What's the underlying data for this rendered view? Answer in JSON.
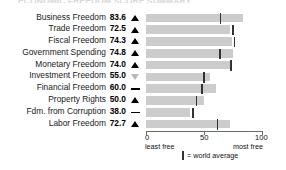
{
  "title_cut": "ECONOMIC FREEDOM SCORE SUMMARY",
  "chart_data": {
    "type": "bar",
    "title": "Economic Freedom Score Summary",
    "xlabel": "",
    "ylabel": "",
    "xlim": [
      0,
      100
    ],
    "grid": false,
    "orientation": "horizontal",
    "categories": [
      "Business Freedom",
      "Trade Freedom",
      "Fiscal Freedom",
      "Government Spending",
      "Monetary Freedom",
      "Investment Freedom",
      "Financial Freedom",
      "Property Rights",
      "Fdm. from Corruption",
      "Labor Freedom"
    ],
    "values": [
      83.6,
      72.5,
      74.3,
      74.8,
      74.0,
      55.0,
      60.0,
      50.0,
      38.0,
      72.7
    ],
    "value_labels": [
      "83.6",
      "72.5",
      "74.3",
      "74.8",
      "74.0",
      "55.0",
      "60.0",
      "50.0",
      "38.0",
      "72.7"
    ],
    "trend_markers": [
      "up",
      "up",
      "up",
      "up",
      "up",
      "down",
      "flat",
      "up",
      "flat",
      "up"
    ],
    "world_average": [
      64.3,
      74.8,
      76.3,
      63.9,
      73.4,
      50.2,
      48.5,
      43.6,
      40.5,
      61.5
    ],
    "ticks": [
      0,
      50,
      100
    ],
    "tick_labels": [
      "0",
      "50",
      "100"
    ],
    "axis_end_labels": [
      "least free",
      "most free"
    ],
    "legend": "= world average",
    "colors": {
      "bar": "#cccccc",
      "average_tick": "#333333",
      "marker_up": "#000000",
      "marker_down": "#b9b9b9",
      "axis": "#6a6a6a"
    }
  },
  "axis": {
    "tick0": "0",
    "tick50": "50",
    "tick100": "100",
    "least_free": "least free",
    "most_free": "most free"
  },
  "legend": {
    "text": "= world average"
  }
}
